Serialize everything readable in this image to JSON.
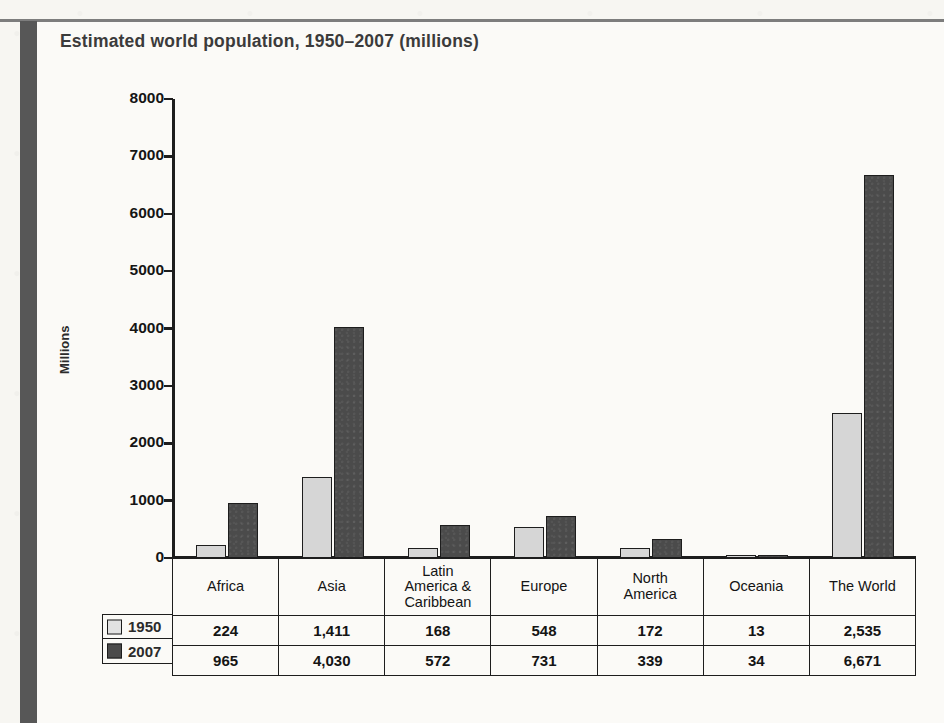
{
  "page": {
    "title": "Estimated world population, 1950–2007 (millions)",
    "accent_dark": "#4b4b4b",
    "accent_light": "#d6d6d6",
    "rule_color": "#7d7d7d",
    "paper_color": "#f7f6f2"
  },
  "chart_data": {
    "type": "bar",
    "title": "Estimated world population, 1950–2007 (millions)",
    "xlabel": "",
    "ylabel": "Millions",
    "ylim": [
      0,
      8000
    ],
    "yticks": [
      0,
      1000,
      2000,
      3000,
      4000,
      5000,
      6000,
      7000,
      8000
    ],
    "ytick_labels": [
      "0",
      "1000",
      "2000",
      "3000",
      "4000",
      "5000",
      "6000",
      "7000",
      "8000"
    ],
    "grid": false,
    "legend_position": "table-left",
    "categories": [
      "Africa",
      "Asia",
      "Latin America & Caribbean",
      "Europe",
      "North America",
      "Oceania",
      "The World"
    ],
    "category_labels": [
      [
        "Africa"
      ],
      [
        "Asia"
      ],
      [
        "Latin",
        "America &",
        "Caribbean"
      ],
      [
        "Europe"
      ],
      [
        "North",
        "America"
      ],
      [
        "Oceania"
      ],
      [
        "The World"
      ]
    ],
    "series": [
      {
        "name": "1950",
        "color": "#d6d6d6",
        "values": [
          224,
          1411,
          168,
          548,
          172,
          13,
          2535
        ],
        "value_labels": [
          "224",
          "1,411",
          "168",
          "548",
          "172",
          "13",
          "2,535"
        ]
      },
      {
        "name": "2007",
        "color": "#4b4b4b",
        "values": [
          965,
          4030,
          572,
          731,
          339,
          34,
          6671
        ],
        "value_labels": [
          "965",
          "4,030",
          "572",
          "731",
          "339",
          "34",
          "6,671"
        ]
      }
    ]
  },
  "table": {
    "corner_label": "",
    "column_headers": [
      "Africa",
      "Asia",
      "Latin America & Caribbean",
      "Europe",
      "North America",
      "Oceania",
      "The World"
    ],
    "rows": [
      {
        "legend_label": "1950",
        "swatch": "light-swatch",
        "cells": [
          "224",
          "1,411",
          "168",
          "548",
          "172",
          "13",
          "2,535"
        ]
      },
      {
        "legend_label": "2007",
        "swatch": "dark-swatch",
        "cells": [
          "965",
          "4,030",
          "572",
          "731",
          "339",
          "34",
          "6,671"
        ]
      }
    ]
  }
}
